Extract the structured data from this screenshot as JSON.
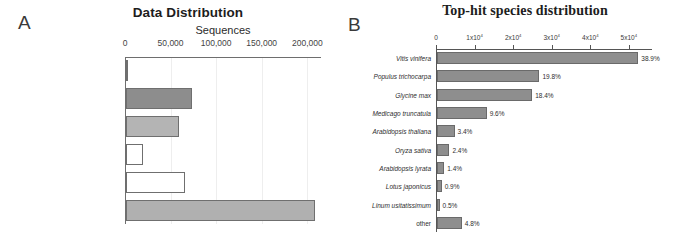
{
  "figure": {
    "panels": [
      {
        "letter": "A",
        "title": "Data Distribution"
      },
      {
        "letter": "B",
        "title": "Top-hit species distribution"
      }
    ]
  },
  "chart_data": [
    {
      "type": "bar",
      "panel": "A",
      "title": "Data Distribution",
      "orientation": "horizontal",
      "xlabel": "Sequences",
      "ylabel": "",
      "xlim": [
        0,
        215000
      ],
      "grid": true,
      "legend": "none",
      "ticks": [
        {
          "value": 0,
          "label": "0"
        },
        {
          "value": 50000,
          "label": "50,000"
        },
        {
          "value": 100000,
          "label": "100,000"
        },
        {
          "value": 150000,
          "label": "150,000"
        },
        {
          "value": 200000,
          "label": "200,000"
        }
      ],
      "categories": [
        "Without Blast Results",
        "Without Blast Hits",
        "With Blast Results",
        "With Mapping Results",
        "Annotated Sequences",
        "Total Sequences"
      ],
      "values": [
        1200,
        72000,
        58000,
        19000,
        65000,
        207000
      ],
      "bar_fills": [
        "#8d8d8d",
        "#8d8d8d",
        "#b4b4b4",
        "#ffffff",
        "#ffffff",
        "#b0b0b0"
      ]
    },
    {
      "type": "bar",
      "panel": "B",
      "title": "Top-hit species distribution",
      "orientation": "horizontal",
      "xlabel": "",
      "ylabel": "",
      "xlim": [
        0,
        56000
      ],
      "grid": false,
      "legend": "none",
      "ticks": [
        {
          "value": 0,
          "label": "0",
          "mantissa": "0",
          "exponent": ""
        },
        {
          "value": 10000,
          "label": "1x10^4",
          "mantissa": "1x10",
          "exponent": "4"
        },
        {
          "value": 20000,
          "label": "2x10^4",
          "mantissa": "2x10",
          "exponent": "4"
        },
        {
          "value": 30000,
          "label": "3x10^4",
          "mantissa": "3x10",
          "exponent": "4"
        },
        {
          "value": 40000,
          "label": "4x10^4",
          "mantissa": "4x10",
          "exponent": "4"
        },
        {
          "value": 50000,
          "label": "5x10^4",
          "mantissa": "5x10",
          "exponent": "4"
        }
      ],
      "categories": [
        "Vitis vinifera",
        "Populus trichocarpa",
        "Glycine max",
        "Medicago truncatula",
        "Arabidopsis thaliana",
        "Oryza sativa",
        "Arabidopsis lyrata",
        "Lotus japonicus",
        "Linum usitatissimum",
        "other"
      ],
      "categories_italic": [
        true,
        true,
        true,
        true,
        true,
        true,
        true,
        true,
        true,
        false
      ],
      "values": [
        52200,
        26560,
        24690,
        12880,
        4560,
        3220,
        1880,
        1210,
        670,
        6440
      ],
      "percent_labels": [
        "38.9%",
        "19.8%",
        "18.4%",
        "9.6%",
        "3.4%",
        "2.4%",
        "1.4%",
        "0.9%",
        "0.5%",
        "4.8%"
      ],
      "bar_fill": "#8e8e8e"
    }
  ]
}
